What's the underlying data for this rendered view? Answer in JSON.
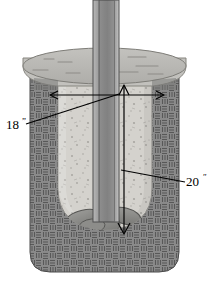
{
  "figure": {
    "background_color": "#ffffff"
  },
  "annotations": {
    "width_dimension": {
      "label": "18",
      "unit": "”",
      "full_text": "18”",
      "meaning": "hole diameter",
      "leader_color": "#000000"
    },
    "depth_dimension": {
      "label": "20",
      "unit": "ʺ",
      "full_text": "20ʺ",
      "meaning": "footing depth",
      "leader_color": "#000000"
    }
  },
  "parts": {
    "soil": {
      "name": "soil",
      "fill_color": "#8a8a8a",
      "hatch_color": "#5e5e5e",
      "hatch_style": "basket-weave"
    },
    "concrete_footing": {
      "name": "concrete-footing",
      "fill_color": "#d4d2cd",
      "edge_color": "#9b9b96",
      "speckle_color": "#a9a7a2"
    },
    "slab_collar": {
      "name": "concrete-slab-collar",
      "top_fill": "#b9b8b4",
      "front_fill": "#c9c8c4",
      "edge_color": "#8c8c88",
      "score_line_color": "#8f8e8a"
    },
    "post": {
      "name": "post",
      "face_color": "#9a9a9a",
      "left_edge_color": "#b6b6b6",
      "right_edge_color": "#c4c4c4",
      "outline_color": "#4a4a4a"
    },
    "gravel": {
      "name": "gravel-base",
      "fill_color": "#8b8b88",
      "edge_color": "#5a5a58",
      "highlight_color": "#a3a3a0"
    }
  },
  "colors": {
    "line": "#000000",
    "white": "#ffffff"
  }
}
